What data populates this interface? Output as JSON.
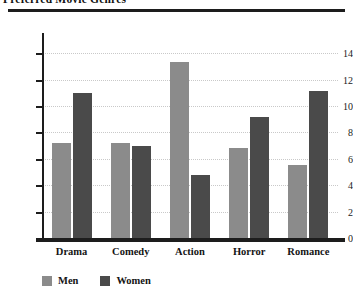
{
  "chart_data": {
    "type": "bar",
    "title": "Preferred Movie Genres",
    "title_clipped": true,
    "xlabel": "",
    "ylabel": "",
    "categories": [
      "Drama",
      "Comedy",
      "Action",
      "Horror",
      "Romance"
    ],
    "series": [
      {
        "name": "Men",
        "color": "#8b8b8b",
        "values": [
          7.2,
          7.2,
          13.3,
          6.8,
          5.5
        ]
      },
      {
        "name": "Women",
        "color": "#4a4a4a",
        "values": [
          11.0,
          7.0,
          4.8,
          9.2,
          11.1
        ]
      }
    ],
    "ylim": [
      0,
      15
    ],
    "yticks": [
      0,
      2,
      4,
      6,
      8,
      10,
      12,
      14
    ],
    "ytick_labels": [
      "0",
      "2",
      "4",
      "6",
      "8",
      "10",
      "12",
      "14"
    ],
    "grid": true,
    "grid_axis": "y",
    "grid_style": "dotted",
    "grid_color": "#c9c9c9",
    "legend_position": "bottom-left",
    "background": "#ffffff",
    "axis_color": "#1d1d1d"
  }
}
